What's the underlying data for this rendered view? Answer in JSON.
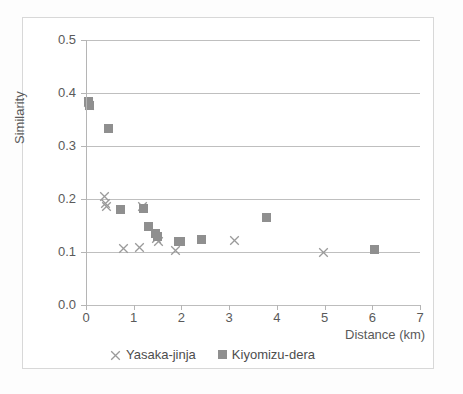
{
  "chart_data": {
    "type": "scatter",
    "title": "",
    "xlabel": "Distance (km)",
    "ylabel": "Similarity",
    "xlim": [
      0,
      7
    ],
    "ylim": [
      0.0,
      0.5
    ],
    "xticks": [
      "0",
      "1",
      "2",
      "3",
      "4",
      "5",
      "6",
      "7"
    ],
    "yticks": [
      "0.0",
      "0.1",
      "0.2",
      "0.3",
      "0.4",
      "0.5"
    ],
    "xtick_values": [
      0,
      1,
      2,
      3,
      4,
      5,
      6,
      7
    ],
    "ytick_values": [
      0.0,
      0.1,
      0.2,
      0.3,
      0.4,
      0.5
    ],
    "grid": "horizontal",
    "legend_position": "bottom",
    "series": [
      {
        "name": "Yasaka-jinja",
        "marker": "cross",
        "color": "#9a9a9a",
        "points": [
          [
            0.05,
            0.383
          ],
          [
            0.08,
            0.377
          ],
          [
            0.38,
            0.205
          ],
          [
            0.4,
            0.192
          ],
          [
            0.42,
            0.185
          ],
          [
            1.18,
            0.185
          ],
          [
            0.78,
            0.107
          ],
          [
            1.12,
            0.108
          ],
          [
            1.48,
            0.125
          ],
          [
            1.52,
            0.12
          ],
          [
            1.88,
            0.103
          ],
          [
            3.12,
            0.122
          ],
          [
            4.97,
            0.1
          ]
        ]
      },
      {
        "name": "Kiyomizu-dera",
        "marker": "square",
        "color": "#8f8f8f",
        "points": [
          [
            0.06,
            0.384
          ],
          [
            0.07,
            0.377
          ],
          [
            0.47,
            0.333
          ],
          [
            0.73,
            0.181
          ],
          [
            1.2,
            0.183
          ],
          [
            1.3,
            0.148
          ],
          [
            1.45,
            0.135
          ],
          [
            1.5,
            0.13
          ],
          [
            1.93,
            0.12
          ],
          [
            1.99,
            0.12
          ],
          [
            2.42,
            0.124
          ],
          [
            3.78,
            0.166
          ],
          [
            6.05,
            0.105
          ]
        ]
      }
    ]
  },
  "axes": {
    "y_title": "Similarity",
    "x_title": "Distance (km)"
  },
  "legend": {
    "items": [
      {
        "label": "Yasaka-jinja",
        "marker": "cross"
      },
      {
        "label": "Kiyomizu-dera",
        "marker": "square"
      }
    ]
  },
  "colors": {
    "marker_gray": "#8f8f8f",
    "cross_gray": "#9a9a9a",
    "gridline": "#bfbfbf",
    "text": "#5a5a5a",
    "frame": "#d8d8d8"
  }
}
